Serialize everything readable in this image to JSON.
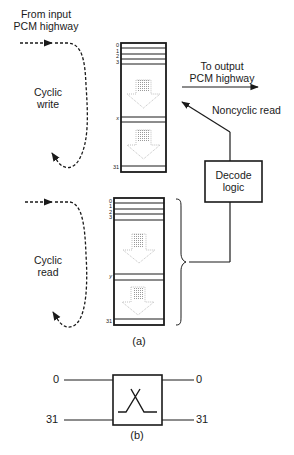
{
  "diagram": {
    "part_a": {
      "caption": "(a)",
      "input_label_line1": "From input",
      "input_label_line2": "PCM highway",
      "output_label_line1": "To output",
      "output_label_line2": "PCM highway",
      "cyclic_write_line1": "Cyclic",
      "cyclic_write_line2": "write",
      "cyclic_read_line1": "Cyclic",
      "cyclic_read_line2": "read",
      "noncyclic_read": "Noncyclic read",
      "decode_line1": "Decode",
      "decode_line2": "logic",
      "write_store": {
        "indices": [
          "0",
          "1",
          "2",
          "3"
        ],
        "pointer": "x",
        "last": "31"
      },
      "read_store": {
        "indices": [
          "0",
          "1",
          "2",
          "3"
        ],
        "pointer": "y",
        "last": "31"
      }
    },
    "part_b": {
      "caption": "(b)",
      "in_top": "0",
      "in_bottom": "31",
      "out_top": "0",
      "out_bottom": "31"
    }
  }
}
